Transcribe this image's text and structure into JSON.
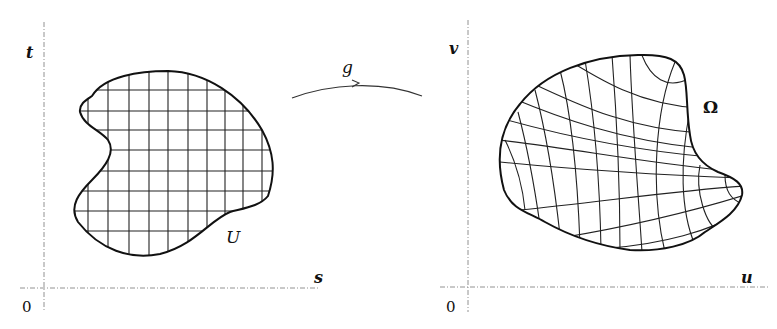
{
  "figure": {
    "left_panel": {
      "origin_label": "0",
      "x_axis_label": "s",
      "y_axis_label": "t",
      "region_label": "U",
      "grid_type": "rectangular"
    },
    "mapping": {
      "label": "g",
      "arrow": "curved-arrow-right"
    },
    "right_panel": {
      "origin_label": "0",
      "x_axis_label": "u",
      "y_axis_label": "v",
      "region_label": "Ω",
      "grid_type": "curvilinear"
    },
    "colors": {
      "ink": "#111111",
      "axis": "#777777",
      "background": "#ffffff"
    }
  }
}
